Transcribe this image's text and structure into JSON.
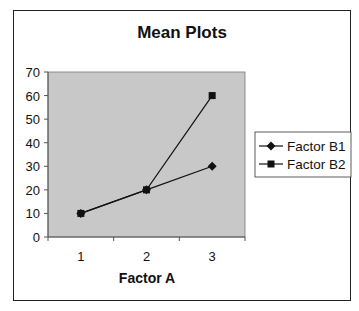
{
  "chart_data": {
    "type": "line",
    "title": "Mean Plots",
    "xlabel": "Factor A",
    "ylabel": "",
    "categories": [
      "1",
      "2",
      "3"
    ],
    "ylim": [
      0,
      70
    ],
    "yticks": [
      "0",
      "10",
      "20",
      "30",
      "40",
      "50",
      "60",
      "70"
    ],
    "grid": false,
    "legend_position": "right",
    "series": [
      {
        "name": "Factor B1",
        "marker": "diamond",
        "values": [
          10,
          20,
          30
        ]
      },
      {
        "name": "Factor B2",
        "marker": "square",
        "values": [
          10,
          20,
          60
        ]
      }
    ],
    "colors": {
      "plot_background": "#c8c8c8",
      "line": "#111111"
    }
  }
}
